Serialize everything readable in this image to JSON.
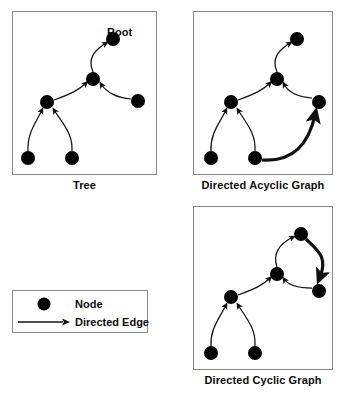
{
  "figure": {
    "title": "",
    "node_color": "#000000",
    "edge_color": "#1a1a1a",
    "panel_border_color": "#8a8a8a",
    "background": "#ffffff"
  },
  "legend": {
    "items": [
      {
        "glyph": "node-dot",
        "label": "Node"
      },
      {
        "glyph": "arrow-line",
        "label": "Directed Edge"
      }
    ]
  },
  "annotations": {
    "root_label": "Root"
  },
  "panels": [
    {
      "id": "tree",
      "caption": "Tree",
      "nodes": [
        {
          "id": "root",
          "cx": 100,
          "cy": 27,
          "r": 7,
          "label": "Root"
        },
        {
          "id": "mid",
          "cx": 80,
          "cy": 67,
          "r": 7,
          "label": ""
        },
        {
          "id": "left",
          "cx": 34,
          "cy": 90,
          "r": 7,
          "label": ""
        },
        {
          "id": "right",
          "cx": 125,
          "cy": 89,
          "r": 7,
          "label": ""
        },
        {
          "id": "bl",
          "cx": 15,
          "cy": 146,
          "r": 7,
          "label": ""
        },
        {
          "id": "br",
          "cx": 59,
          "cy": 146,
          "r": 7,
          "label": ""
        }
      ],
      "edges": [
        {
          "from": "mid",
          "to": "root",
          "style": "thin"
        },
        {
          "from": "left",
          "to": "mid",
          "style": "thin"
        },
        {
          "from": "right",
          "to": "mid",
          "style": "thin"
        },
        {
          "from": "bl",
          "to": "left",
          "style": "thin"
        },
        {
          "from": "br",
          "to": "left",
          "style": "thin"
        }
      ]
    },
    {
      "id": "dag",
      "caption": "Directed Acyclic Graph",
      "nodes": [
        {
          "id": "top",
          "cx": 103,
          "cy": 27,
          "r": 7,
          "label": ""
        },
        {
          "id": "mid",
          "cx": 83,
          "cy": 67,
          "r": 7,
          "label": ""
        },
        {
          "id": "left",
          "cx": 37,
          "cy": 90,
          "r": 7,
          "label": ""
        },
        {
          "id": "right",
          "cx": 125,
          "cy": 90,
          "r": 7,
          "label": ""
        },
        {
          "id": "bl",
          "cx": 17,
          "cy": 146,
          "r": 7,
          "label": ""
        },
        {
          "id": "br",
          "cx": 61,
          "cy": 146,
          "r": 7,
          "label": ""
        }
      ],
      "edges": [
        {
          "from": "mid",
          "to": "top",
          "style": "thin"
        },
        {
          "from": "left",
          "to": "mid",
          "style": "thin"
        },
        {
          "from": "right",
          "to": "mid",
          "style": "thin"
        },
        {
          "from": "bl",
          "to": "left",
          "style": "thin"
        },
        {
          "from": "br",
          "to": "left",
          "style": "thin"
        },
        {
          "from": "br",
          "to": "right",
          "style": "thick"
        }
      ]
    },
    {
      "id": "dcg",
      "caption": "Directed Cyclic Graph",
      "nodes": [
        {
          "id": "top",
          "cx": 107,
          "cy": 27,
          "r": 7,
          "label": ""
        },
        {
          "id": "mid",
          "cx": 83,
          "cy": 67,
          "r": 7,
          "label": ""
        },
        {
          "id": "left",
          "cx": 37,
          "cy": 90,
          "r": 7,
          "label": ""
        },
        {
          "id": "right",
          "cx": 125,
          "cy": 84,
          "r": 7,
          "label": ""
        },
        {
          "id": "bl",
          "cx": 17,
          "cy": 146,
          "r": 7,
          "label": ""
        },
        {
          "id": "br",
          "cx": 61,
          "cy": 146,
          "r": 7,
          "label": ""
        }
      ],
      "edges": [
        {
          "from": "mid",
          "to": "top",
          "style": "thin"
        },
        {
          "from": "left",
          "to": "mid",
          "style": "thin"
        },
        {
          "from": "right",
          "to": "mid",
          "style": "thin"
        },
        {
          "from": "bl",
          "to": "left",
          "style": "thin"
        },
        {
          "from": "br",
          "to": "left",
          "style": "thin"
        },
        {
          "from": "top",
          "to": "right",
          "style": "thick"
        }
      ]
    }
  ]
}
